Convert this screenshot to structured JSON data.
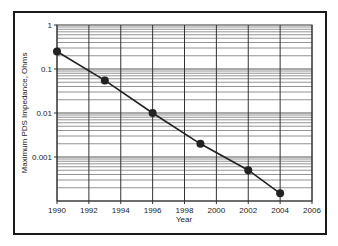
{
  "chart_data": {
    "type": "line",
    "title": "",
    "xlabel": "Year",
    "ylabel": "Maximum PDS Impedance, Ohms",
    "yscale": "log",
    "xlim": [
      1990,
      2006
    ],
    "ylim": [
      0.0001,
      1
    ],
    "x_ticks": [
      "1990",
      "1992",
      "1994",
      "1996",
      "1998",
      "2000",
      "2002",
      "2004",
      "2006"
    ],
    "y_ticks": [
      "1",
      "0.1",
      "0.01",
      "0.001"
    ],
    "grid": true,
    "legend": null,
    "series": [
      {
        "name": "Maximum PDS Impedance",
        "marker": "circle",
        "line_style": "solid",
        "color": "#222222",
        "x": [
          1990,
          1993,
          1996,
          1999,
          2002,
          2004
        ],
        "values": [
          0.25,
          0.055,
          0.01,
          0.002,
          0.0005,
          0.00015
        ]
      }
    ]
  }
}
